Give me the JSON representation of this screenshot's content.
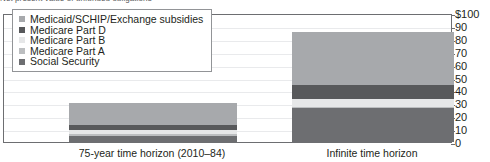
{
  "caption": {
    "text": "Net present value of unfunded obligations"
  },
  "legend": {
    "items": [
      {
        "label": "Medicaid/SCHIP/Exchange subsidies",
        "color": "#a7a9ac",
        "key": "medicaid"
      },
      {
        "label": "Medicare Part D",
        "color": "#58595b",
        "key": "part_d"
      },
      {
        "label": "Medicare Part B",
        "color": "#e6e7e8",
        "key": "part_b"
      },
      {
        "label": "Medicare Part A",
        "color": "#bcbec0",
        "key": "part_a"
      },
      {
        "label": "Social Security",
        "color": "#6d6e71",
        "key": "social_security"
      }
    ]
  },
  "axis": {
    "y_ticks": [
      "$100",
      "90",
      "80",
      "70",
      "60",
      "50",
      "40",
      "30",
      "20",
      "10",
      "0"
    ],
    "y_min": 0,
    "y_max": 100
  },
  "chart_data": {
    "type": "bar",
    "stacked": true,
    "title": "Net present value of unfunded obligations",
    "xlabel": "",
    "ylabel": "$",
    "ylim": [
      0,
      100
    ],
    "grid": true,
    "legend_position": "top-left",
    "categories": [
      "75-year time horizon (2010–84)",
      "Infinite time horizon"
    ],
    "series": [
      {
        "name": "Social Security",
        "color": "#6d6e71",
        "values": [
          5,
          26
        ]
      },
      {
        "name": "Medicare Part A",
        "color": "#bcbec0",
        "values": [
          1.5,
          1.5
        ]
      },
      {
        "name": "Medicare Part B",
        "color": "#e6e7e8",
        "values": [
          3,
          6
        ]
      },
      {
        "name": "Medicare Part D",
        "color": "#58595b",
        "values": [
          4,
          11
        ]
      },
      {
        "name": "Medicaid/SCHIP/Exchange subsidies",
        "color": "#a7a9ac",
        "values": [
          17,
          41
        ]
      }
    ],
    "totals": [
      30.5,
      85.5
    ]
  },
  "colors": {
    "axis": "#6d6e71",
    "grid": "#e9eaec",
    "text": "#231f20",
    "background": "#ffffff"
  }
}
